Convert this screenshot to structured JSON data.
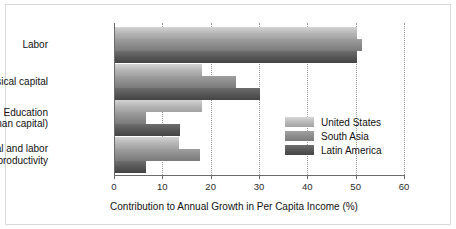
{
  "chart_data": {
    "type": "bar",
    "orientation": "horizontal",
    "title": "",
    "subtitle": "",
    "xlabel": "Contribution to Annual Growth in Per Capita Income (%)",
    "ylabel": "",
    "xlim": [
      0,
      60
    ],
    "xticks": [
      0,
      10,
      20,
      30,
      40,
      50,
      60
    ],
    "xticklabels": [
      "0",
      "10",
      "20",
      "30",
      "40",
      "50",
      "60"
    ],
    "grid": "vertical-dotted",
    "legend_position": "middle-right-inside",
    "categories": [
      "Labor",
      "Physical capital",
      "Education\n(human capital)",
      "Capital and labor\nproductivity"
    ],
    "category_lines": [
      [
        "Labor"
      ],
      [
        "Physical capital"
      ],
      [
        "Education",
        "(human capital)"
      ],
      [
        "Capital and labor",
        "productivity"
      ]
    ],
    "series": [
      {
        "name": "United States",
        "color": "#b6b6b6",
        "values": [
          50.0,
          18.0,
          18.0,
          13.3
        ]
      },
      {
        "name": "South Asia",
        "color": "#8c8c8c",
        "values": [
          51.0,
          25.0,
          6.5,
          17.6
        ]
      },
      {
        "name": "Latin America",
        "color": "#565656",
        "values": [
          50.0,
          30.0,
          13.5,
          6.5
        ]
      }
    ]
  },
  "legend": {
    "items": [
      {
        "label": "United States"
      },
      {
        "label": "South Asia"
      },
      {
        "label": "Latin America"
      }
    ]
  }
}
